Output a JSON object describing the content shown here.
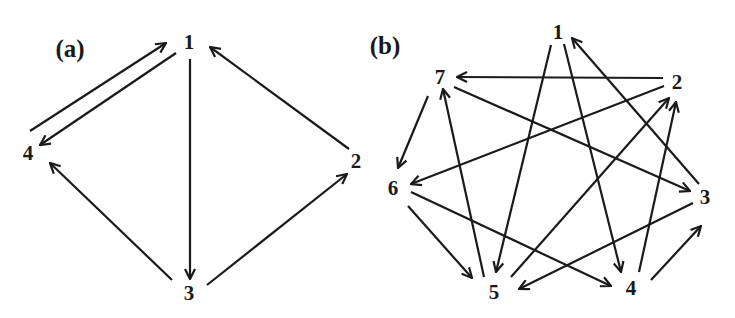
{
  "colors": {
    "ink": "#1a1a1a",
    "background": "#ffffff"
  },
  "panels": [
    {
      "id": "a",
      "label": "(a)",
      "label_pos": [
        70,
        48
      ],
      "nodes": [
        {
          "id": "1",
          "label": "1",
          "x": 189,
          "y": 42
        },
        {
          "id": "2",
          "label": "2",
          "x": 356,
          "y": 161
        },
        {
          "id": "3",
          "label": "3",
          "x": 189,
          "y": 293
        },
        {
          "id": "4",
          "label": "4",
          "x": 28,
          "y": 153
        }
      ],
      "edges": [
        {
          "from": "4",
          "to": "1",
          "x1": 30,
          "y1": 131,
          "x2": 166,
          "y2": 43
        },
        {
          "from": "1",
          "to": "4",
          "x1": 176,
          "y1": 53,
          "x2": 40,
          "y2": 145
        },
        {
          "from": "1",
          "to": "3",
          "x1": 190,
          "y1": 59,
          "x2": 190,
          "y2": 279
        },
        {
          "from": "2",
          "to": "1",
          "x1": 349,
          "y1": 149,
          "x2": 210,
          "y2": 47
        },
        {
          "from": "3",
          "to": "2",
          "x1": 207,
          "y1": 285,
          "x2": 347,
          "y2": 174
        },
        {
          "from": "3",
          "to": "4",
          "x1": 172,
          "y1": 280,
          "x2": 50,
          "y2": 163
        }
      ]
    },
    {
      "id": "b",
      "label": "(b)",
      "label_pos": [
        385,
        45
      ],
      "nodes": [
        {
          "id": "1",
          "label": "1",
          "x": 558,
          "y": 32
        },
        {
          "id": "2",
          "label": "2",
          "x": 677,
          "y": 82
        },
        {
          "id": "3",
          "label": "3",
          "x": 705,
          "y": 197
        },
        {
          "id": "4",
          "label": "4",
          "x": 631,
          "y": 288
        },
        {
          "id": "5",
          "label": "5",
          "x": 494,
          "y": 292
        },
        {
          "id": "6",
          "label": "6",
          "x": 393,
          "y": 188
        },
        {
          "id": "7",
          "label": "7",
          "x": 440,
          "y": 77
        }
      ],
      "edges": [
        {
          "from": "1",
          "to": "5",
          "x1": 551,
          "y1": 45,
          "x2": 496,
          "y2": 272
        },
        {
          "from": "1",
          "to": "4",
          "x1": 564,
          "y1": 44,
          "x2": 621,
          "y2": 272
        },
        {
          "from": "3",
          "to": "1",
          "x1": 699,
          "y1": 184,
          "x2": 572,
          "y2": 38
        },
        {
          "from": "2",
          "to": "7",
          "x1": 663,
          "y1": 78,
          "x2": 457,
          "y2": 77
        },
        {
          "from": "2",
          "to": "6",
          "x1": 664,
          "y1": 86,
          "x2": 411,
          "y2": 184
        },
        {
          "from": "7",
          "to": "3",
          "x1": 454,
          "y1": 87,
          "x2": 690,
          "y2": 191
        },
        {
          "from": "7",
          "to": "6",
          "x1": 428,
          "y1": 96,
          "x2": 398,
          "y2": 168
        },
        {
          "from": "5",
          "to": "7",
          "x1": 484,
          "y1": 277,
          "x2": 443,
          "y2": 89
        },
        {
          "from": "5",
          "to": "2",
          "x1": 511,
          "y1": 277,
          "x2": 669,
          "y2": 98
        },
        {
          "from": "4",
          "to": "2",
          "x1": 639,
          "y1": 272,
          "x2": 676,
          "y2": 102
        },
        {
          "from": "4",
          "to": "3",
          "x1": 651,
          "y1": 280,
          "x2": 701,
          "y2": 226
        },
        {
          "from": "3",
          "to": "5",
          "x1": 693,
          "y1": 203,
          "x2": 519,
          "y2": 289
        },
        {
          "from": "6",
          "to": "5",
          "x1": 408,
          "y1": 206,
          "x2": 472,
          "y2": 278
        },
        {
          "from": "6",
          "to": "4",
          "x1": 411,
          "y1": 192,
          "x2": 611,
          "y2": 286
        }
      ]
    }
  ]
}
